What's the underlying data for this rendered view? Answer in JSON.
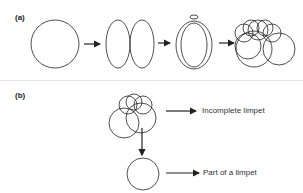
{
  "panels": {
    "a": {
      "label": "(a)"
    },
    "b": {
      "label": "(b)",
      "outcome_top": "Incomplete limpet",
      "outcome_bottom": "Part of a limpet"
    }
  },
  "colors": {
    "stroke": "#222222",
    "divider": "#e4e4e4"
  }
}
